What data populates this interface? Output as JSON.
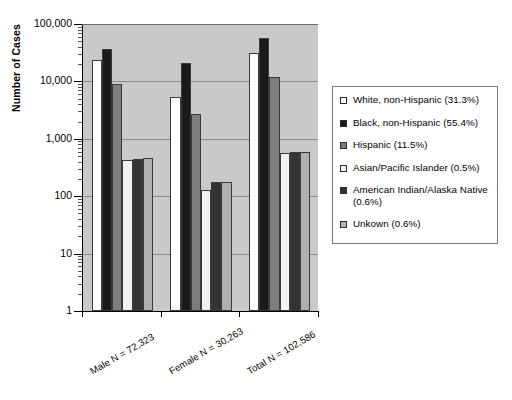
{
  "chart_data": {
    "type": "bar",
    "title": "",
    "xlabel": "",
    "ylabel": "Number of Cases",
    "yscale": "log",
    "ylim": [
      1,
      100000
    ],
    "ytick_labels": [
      "1",
      "10",
      "100",
      "1,000",
      "10,000",
      "100,000"
    ],
    "ytick_values": [
      1,
      10,
      100,
      1000,
      10000,
      100000
    ],
    "grid": true,
    "legend_position": "right",
    "categories": [
      "Male N = 72,323",
      "Female N = 30,263",
      "Total N = 102,586"
    ],
    "series": [
      {
        "name": "White, non-Hispanic (31.3%)",
        "color": "#ffffff",
        "values": [
          24000,
          5400,
          31000
        ]
      },
      {
        "name": "Black, non-Hispanic (55.4%)",
        "color": "#1a1a1a",
        "values": [
          36000,
          21000,
          57000
        ]
      },
      {
        "name": "Hispanic (11.5%)",
        "color": "#7d7d7d",
        "values": [
          9000,
          2700,
          11800
        ]
      },
      {
        "name": "Asian/Pacific Islander (0.5%)",
        "color": "#f2f2f2",
        "values": [
          430,
          130,
          560
        ]
      },
      {
        "name": "American Indian/Alaska Native (0.6%)",
        "color": "#333333",
        "values": [
          440,
          180,
          600
        ]
      },
      {
        "name": "Unkown (0.6%)",
        "color": "#b0b0b0",
        "values": [
          460,
          180,
          580
        ]
      }
    ]
  },
  "legend": {
    "items": [
      {
        "label": "White, non-Hispanic (31.3%)"
      },
      {
        "label": "Black, non-Hispanic (55.4%)"
      },
      {
        "label": "Hispanic (11.5%)"
      },
      {
        "label": "Asian/Pacific Islander (0.5%)"
      },
      {
        "label": "American Indian/Alaska Native (0.6%)"
      },
      {
        "label": "Unkown (0.6%)"
      }
    ]
  },
  "axis": {
    "y_title": "Number of Cases"
  },
  "colors": {
    "plot_background": "#c9c9c9",
    "gridline": "#8a8a8a",
    "axis": "#000000",
    "legend_border": "#7a7a7a"
  }
}
